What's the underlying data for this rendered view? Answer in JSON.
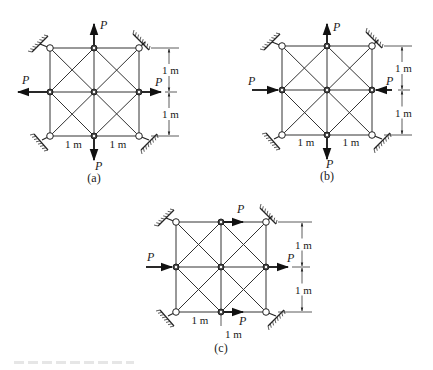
{
  "figure": {
    "unit_label": "1 m",
    "force_label": "P",
    "colors": {
      "line": "#333333",
      "background": "#ffffff"
    }
  },
  "panels": [
    {
      "id": "a",
      "caption": "(a)",
      "caption_pos": [
        94,
        182
      ],
      "grid": {
        "xs": [
          50,
          94,
          139
        ],
        "ys": [
          48,
          92,
          136
        ]
      },
      "supports": [
        {
          "node": [
            0,
            0
          ],
          "dir": "nw"
        },
        {
          "node": [
            2,
            0
          ],
          "dir": "ne"
        },
        {
          "node": [
            0,
            2
          ],
          "dir": "sw"
        },
        {
          "node": [
            2,
            2
          ],
          "dir": "se"
        }
      ],
      "forces": [
        {
          "node": [
            1,
            0
          ],
          "dx": 0,
          "dy": -1,
          "len": 24,
          "label": "P",
          "label_pos": [
            100,
            29
          ]
        },
        {
          "node": [
            0,
            1
          ],
          "dx": -1,
          "dy": 0,
          "len": 32,
          "label": "P",
          "label_pos": [
            22,
            84
          ]
        },
        {
          "node": [
            2,
            1
          ],
          "dx": 1,
          "dy": 0,
          "len": 22,
          "label": "P",
          "label_pos": [
            155,
            86
          ]
        },
        {
          "node": [
            1,
            2
          ],
          "dx": 0,
          "dy": 1,
          "len": 24,
          "label": "P",
          "label_pos": [
            95,
            170
          ]
        }
      ],
      "dims": {
        "vertical_x": 169,
        "vertical_labels": [
          "1 m",
          "1 m"
        ],
        "horizontal_labels": [
          "1 m",
          "1 m"
        ],
        "horizontal_y": 148
      }
    },
    {
      "id": "b",
      "caption": "(b)",
      "caption_pos": [
        327,
        180
      ],
      "grid": {
        "xs": [
          282,
          327,
          372
        ],
        "ys": [
          46,
          90,
          135
        ]
      },
      "supports": [
        {
          "node": [
            0,
            0
          ],
          "dir": "nw"
        },
        {
          "node": [
            2,
            0
          ],
          "dir": "ne"
        },
        {
          "node": [
            0,
            2
          ],
          "dir": "sw"
        },
        {
          "node": [
            2,
            2
          ],
          "dir": "se"
        }
      ],
      "forces": [
        {
          "node": [
            1,
            0
          ],
          "dx": 0,
          "dy": -1,
          "len": 22,
          "label": "P",
          "label_pos": [
            333,
            31
          ]
        },
        {
          "node": [
            0,
            1
          ],
          "dx": 1,
          "dy": 0,
          "len": 30,
          "label": "P",
          "label_pos": [
            248,
            85
          ],
          "toward": true
        },
        {
          "node": [
            2,
            1
          ],
          "dx": -1,
          "dy": 0,
          "len": 20,
          "label": "P",
          "label_pos": [
            386,
            85
          ],
          "toward": true
        },
        {
          "node": [
            1,
            2
          ],
          "dx": 0,
          "dy": 1,
          "len": 24,
          "label": "P",
          "label_pos": [
            326,
            168
          ]
        }
      ],
      "dims": {
        "vertical_x": 402,
        "vertical_labels": [
          "1 m",
          "1 m"
        ],
        "horizontal_labels": [
          "1 m",
          "1 m"
        ],
        "horizontal_y": 146
      }
    },
    {
      "id": "c",
      "caption": "(c)",
      "caption_pos": [
        221,
        352
      ],
      "grid": {
        "xs": [
          176,
          221,
          266
        ],
        "ys": [
          222,
          267,
          312
        ]
      },
      "supports": [
        {
          "node": [
            0,
            0
          ],
          "dir": "nw"
        },
        {
          "node": [
            2,
            0
          ],
          "dir": "ne"
        },
        {
          "node": [
            0,
            2
          ],
          "dir": "sw"
        },
        {
          "node": [
            2,
            2
          ],
          "dir": "se"
        }
      ],
      "forces": [
        {
          "node": [
            1,
            0
          ],
          "dx": 1,
          "dy": 0,
          "len": 22,
          "label": "P",
          "label_pos": [
            237,
            213
          ]
        },
        {
          "node": [
            0,
            1
          ],
          "dx": 1,
          "dy": 0,
          "len": 30,
          "label": "P",
          "label_pos": [
            147,
            261
          ],
          "toward": true
        },
        {
          "node": [
            2,
            1
          ],
          "dx": 1,
          "dy": 0,
          "len": 22,
          "label": "P",
          "label_pos": [
            287,
            262
          ]
        },
        {
          "node": [
            1,
            2
          ],
          "dx": 1,
          "dy": 0,
          "len": 22,
          "label": "P",
          "label_pos": [
            239,
            325
          ]
        }
      ],
      "dims": {
        "vertical_x": 302,
        "vertical_labels": [
          "1 m",
          "1 m"
        ],
        "horizontal_labels": [
          "1 m",
          "1 m"
        ],
        "horizontal_y": 324,
        "second_label_below": true
      }
    }
  ]
}
